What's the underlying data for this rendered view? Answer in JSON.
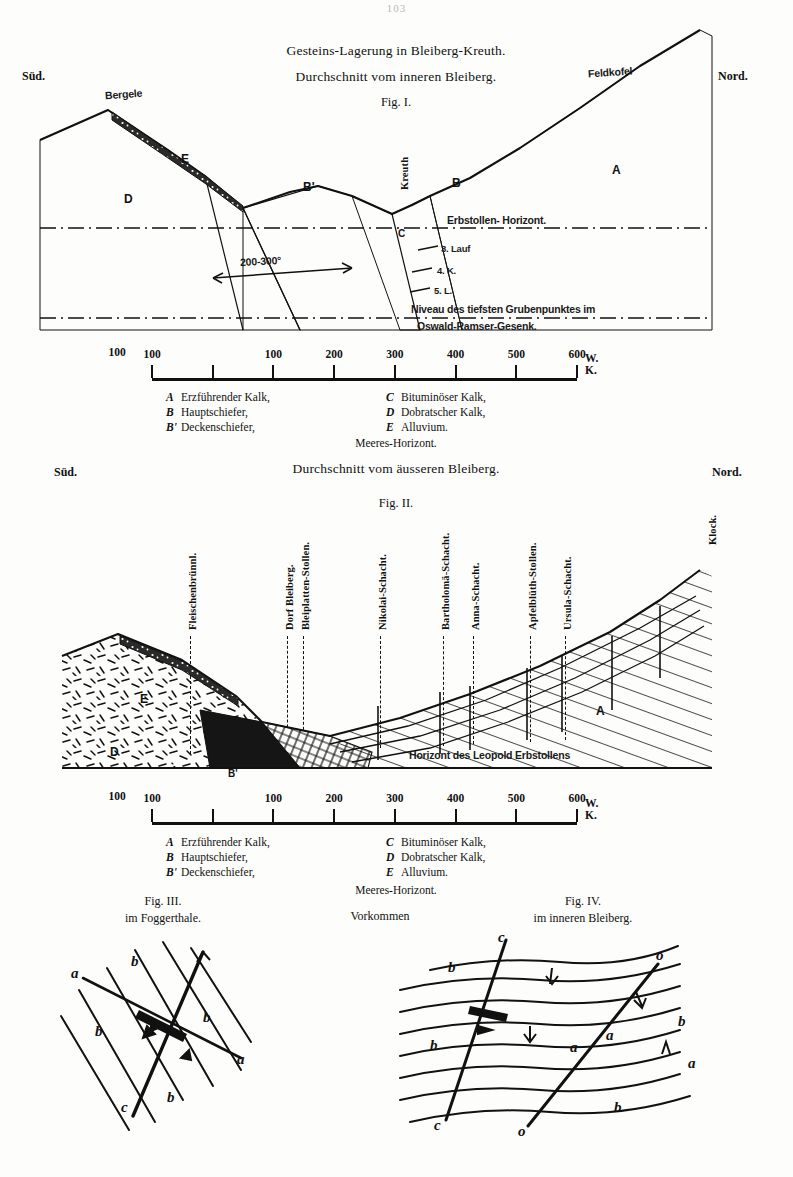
{
  "page": {
    "number": "103"
  },
  "fig1": {
    "title": "Gesteins-Lagerung in Bleiberg-Kreuth.",
    "subtitle": "Durchschnitt vom inneren Bleiberg.",
    "figlabel": "Fig. I.",
    "compass_left": "Süd.",
    "compass_right": "Nord.",
    "peaks": {
      "left": "Bergele",
      "right": "Feldkofel"
    },
    "place": "Kreuth",
    "thickness": "200-300°",
    "strata": {
      "A": "A",
      "B": "B",
      "Bp": "B'",
      "C": "C",
      "D": "D",
      "E": "E"
    },
    "horizons": [
      "Erbstollen- Horizont.",
      "3. Lauf",
      "4. K.",
      "5. L."
    ],
    "deep_point_line1": "Niveau des tiefsten Grubenpunktes im",
    "deep_point_line2": "Oswald-Ramser-Gesenk."
  },
  "fig2": {
    "title": "Durchschnitt vom äusseren Bleiberg.",
    "figlabel": "Fig. II.",
    "compass_left": "Süd.",
    "compass_right": "Nord.",
    "peak_right": "Klock.",
    "strata": {
      "A": "A",
      "B": "B",
      "Bp": "B'",
      "D": "D",
      "E": "E"
    },
    "horizon": "Horizont des Leopold Erbstollens",
    "shafts": [
      {
        "label": "Fleischenbrünnl.",
        "x": 187
      },
      {
        "label": "Dorf Bleiberg.",
        "x": 284
      },
      {
        "label": "Bleiplatten-Stollen.",
        "x": 300
      },
      {
        "label": "Nikolai-Schacht.",
        "x": 377
      },
      {
        "label": "Bartholomä-Schacht.",
        "x": 440
      },
      {
        "label": "Anna-Schacht.",
        "x": 470
      },
      {
        "label": "Apfelblüth-Stollen.",
        "x": 527
      },
      {
        "label": "Ursula-Schacht.",
        "x": 562
      }
    ]
  },
  "scale": {
    "ticks": [
      {
        "label": "100",
        "value": 0
      },
      {
        "label": "",
        "value": 1
      },
      {
        "label": "100",
        "value": 2
      },
      {
        "label": "200",
        "value": 3
      },
      {
        "label": "300",
        "value": 4
      },
      {
        "label": "400",
        "value": 5
      },
      {
        "label": "500",
        "value": 6
      },
      {
        "label": "600",
        "value": 7
      }
    ],
    "unit": "W. K."
  },
  "legend": {
    "left": [
      {
        "key": "A",
        "text": "Erzführender Kalk,"
      },
      {
        "key": "B",
        "text": "Hauptschiefer,"
      },
      {
        "key": "B'",
        "text": "Deckenschiefer,"
      }
    ],
    "right": [
      {
        "key": "C",
        "text": "Bituminöser Kalk,"
      },
      {
        "key": "D",
        "text": "Dobratscher Kalk,"
      },
      {
        "key": "E",
        "text": "Alluvium."
      }
    ],
    "footer": "Meeres-Horizont."
  },
  "fig3": {
    "figlabel": "Fig. III.",
    "caption": "im Foggerthale.",
    "letters": [
      "a",
      "b",
      "b",
      "b",
      "b",
      "a",
      "c"
    ]
  },
  "fig4": {
    "figlabel": "Fig. IV.",
    "caption": "im inneren Bleiberg.",
    "letters": [
      "b",
      "b",
      "b",
      "a",
      "a",
      "b",
      "c",
      "c",
      "o",
      "o"
    ]
  },
  "vorkommen": "Vorkommen",
  "colors": {
    "ink": "#111111",
    "paper": "#fdfdfb",
    "faint": "#b9b9b9"
  }
}
